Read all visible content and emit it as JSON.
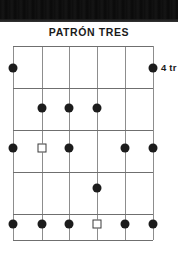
{
  "title": "PATRÓN TRES",
  "fret_label": "4 tr",
  "colors": {
    "ink": "#1c1c1c",
    "string_line": "#8d8d8d",
    "fret_line": "#6f6f6f",
    "background": "#ffffff",
    "scan_band": "#101010"
  },
  "diagram": {
    "type": "fretboard-pattern",
    "string_count": 6,
    "fret_row_count": 5,
    "string_x": [
      13,
      42,
      69,
      97,
      125,
      153
    ],
    "fret_line_y": [
      46,
      88,
      130,
      172,
      214,
      240
    ],
    "row_y": [
      68,
      108,
      148,
      188,
      224
    ],
    "markers": [
      {
        "row": 0,
        "string": 1,
        "shape": "filled",
        "x": 13,
        "y": 68
      },
      {
        "row": 0,
        "string": 6,
        "shape": "filled",
        "x": 153,
        "y": 68
      },
      {
        "row": 1,
        "string": 2,
        "shape": "filled",
        "x": 42,
        "y": 108
      },
      {
        "row": 1,
        "string": 3,
        "shape": "filled",
        "x": 69,
        "y": 108
      },
      {
        "row": 1,
        "string": 4,
        "shape": "filled",
        "x": 97,
        "y": 108
      },
      {
        "row": 2,
        "string": 1,
        "shape": "filled",
        "x": 13,
        "y": 148
      },
      {
        "row": 2,
        "string": 2,
        "shape": "hollow",
        "x": 42,
        "y": 148
      },
      {
        "row": 2,
        "string": 3,
        "shape": "filled",
        "x": 69,
        "y": 148
      },
      {
        "row": 2,
        "string": 5,
        "shape": "filled",
        "x": 125,
        "y": 148
      },
      {
        "row": 2,
        "string": 6,
        "shape": "filled",
        "x": 153,
        "y": 148
      },
      {
        "row": 3,
        "string": 4,
        "shape": "filled",
        "x": 97,
        "y": 188
      },
      {
        "row": 4,
        "string": 1,
        "shape": "filled",
        "x": 13,
        "y": 224
      },
      {
        "row": 4,
        "string": 2,
        "shape": "filled",
        "x": 42,
        "y": 224
      },
      {
        "row": 4,
        "string": 3,
        "shape": "filled",
        "x": 69,
        "y": 224
      },
      {
        "row": 4,
        "string": 4,
        "shape": "hollow",
        "x": 97,
        "y": 224
      },
      {
        "row": 4,
        "string": 5,
        "shape": "filled",
        "x": 125,
        "y": 224
      },
      {
        "row": 4,
        "string": 6,
        "shape": "filled",
        "x": 153,
        "y": 224
      }
    ]
  }
}
